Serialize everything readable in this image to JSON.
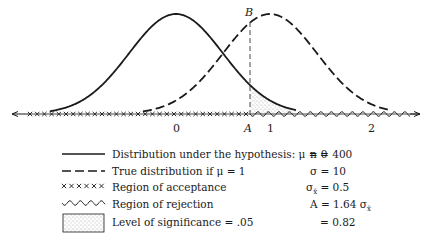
{
  "figure": {
    "point_labels": {
      "B": "B",
      "A": "A"
    },
    "axis_ticks": [
      {
        "label": "0",
        "x": 176
      },
      {
        "label": "A",
        "x": 248
      },
      {
        "label": "1",
        "x": 270
      },
      {
        "label": "2",
        "x": 371
      }
    ],
    "curves": [
      {
        "name": "hypothesis",
        "mean": 0,
        "style": "solid"
      },
      {
        "name": "true",
        "mean": 1,
        "style": "dashed"
      }
    ],
    "colors": {
      "ink": "#1a1a1a",
      "shade": "#9a9a9a",
      "background": "#ffffff"
    }
  },
  "legend": {
    "items": [
      {
        "symbol": "solid-line",
        "label": "Distribution under the hypothesis: μ = 0"
      },
      {
        "symbol": "dashed-line",
        "label": "True distribution if  μ = 1"
      },
      {
        "symbol": "crosses",
        "label": "Region of acceptance"
      },
      {
        "symbol": "wavy-line",
        "label": "Region of rejection"
      },
      {
        "symbol": "stippled-box",
        "label": "Level of significance = .05"
      }
    ]
  },
  "parameters": {
    "n": "n = 400",
    "sigma": "σ = 10",
    "sigma_xbar": "σ",
    "sigma_xbar_sub": "x̄",
    "sigma_xbar_val": " = 0.5",
    "A_def_pre": "A = 1.64 σ",
    "A_def_sub": "x̄",
    "A_val": "= 0.82"
  }
}
